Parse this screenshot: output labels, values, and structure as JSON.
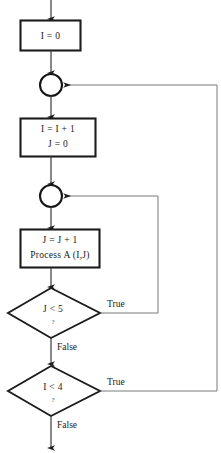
{
  "diagram": {
    "colors": {
      "background": "#ffffff",
      "node_stroke": "#1c1c1c",
      "text": "#1a1a1a",
      "flow_line": "#3a3a3a",
      "loop_line": "#6b6b6b"
    },
    "nodes": {
      "init_i": {
        "type": "process",
        "line1": "I = 0"
      },
      "connector_outer": {
        "type": "connector",
        "label": ""
      },
      "increment_i": {
        "type": "process",
        "line1": "I = I + 1",
        "line2": "J = 0"
      },
      "connector_inner": {
        "type": "connector",
        "label": ""
      },
      "process_a": {
        "type": "process",
        "line1": "J = J + 1",
        "line2": "Process A (I,J)"
      },
      "decision_j": {
        "type": "decision",
        "condition": "J < 5",
        "marker": "?"
      },
      "decision_i": {
        "type": "decision",
        "condition": "I < 4",
        "marker": "?"
      }
    },
    "edges": {
      "j_true": "True",
      "j_false": "False",
      "i_true": "True",
      "i_false": "False"
    }
  }
}
